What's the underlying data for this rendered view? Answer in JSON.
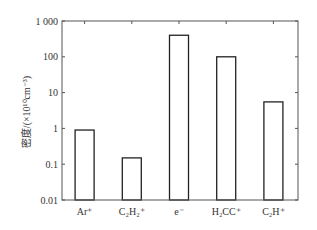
{
  "chart_data": {
    "type": "bar",
    "title": "",
    "xlabel": "",
    "ylabel": "密度/(×10¹⁰cm⁻³)",
    "yscale": "log",
    "ylim": [
      0.01,
      1000
    ],
    "yticks": [
      1000,
      100,
      10,
      1,
      0.1,
      0.01
    ],
    "ytick_labels": [
      "1 000",
      "100",
      "10",
      "1",
      "0.1",
      "0.01"
    ],
    "categories": [
      "Ar⁺",
      "C₂H₂⁺",
      "e⁻",
      "H₂CC⁺",
      "C₂H⁺"
    ],
    "values": [
      0.9,
      0.15,
      400,
      100,
      5.5
    ],
    "grid": false,
    "legend": null,
    "bar_style": {
      "fill": "#ffffff",
      "edge": "#222222"
    }
  }
}
